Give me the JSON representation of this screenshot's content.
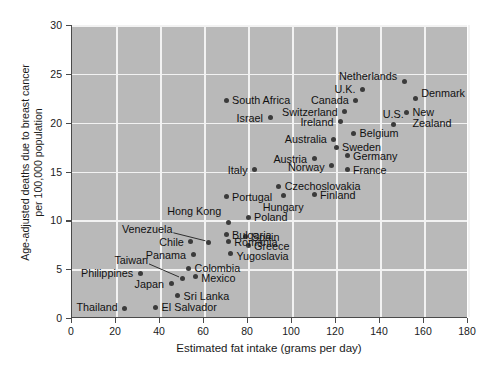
{
  "chart_data": {
    "type": "scatter",
    "title": "",
    "xlabel": "Estimated fat intake (grams per day)",
    "ylabel": "Age-adjusted deaths due to breast cancer per 100,000 population",
    "ylabel_line1": "Age-adjusted deaths due to breast cancer",
    "ylabel_line2": "per 100,000 population",
    "xlim": [
      0,
      180
    ],
    "ylim": [
      0,
      30
    ],
    "xticks": [
      0,
      20,
      40,
      60,
      80,
      100,
      120,
      140,
      160,
      180
    ],
    "yticks": [
      0,
      5,
      10,
      15,
      20,
      25,
      30
    ],
    "grid": true,
    "legend": "none",
    "plot_bg": "#b9b9b9",
    "grid_color": "#f2f2f2",
    "marker_color": "#3b3b3b",
    "points": [
      {
        "label": "Thailand",
        "x": 24,
        "y": 1.0,
        "side": "r",
        "dx": -7,
        "dy": -1,
        "leader": false
      },
      {
        "label": "El Salvador",
        "x": 38,
        "y": 1.1,
        "side": "l",
        "dx": 6,
        "dy": 0,
        "leader": false
      },
      {
        "label": "Sri Lanka",
        "x": 48,
        "y": 2.3,
        "side": "l",
        "dx": 6,
        "dy": 0,
        "leader": false
      },
      {
        "label": "Japan",
        "x": 45,
        "y": 3.5,
        "side": "r",
        "dx": -7,
        "dy": 0,
        "leader": false
      },
      {
        "label": "Taiwan",
        "x": 50,
        "y": 4.0,
        "side": "r",
        "dx": -34,
        "dy": -19,
        "leader": true
      },
      {
        "label": "Philippines",
        "x": 31,
        "y": 4.6,
        "side": "r",
        "dx": -7,
        "dy": 0,
        "leader": false
      },
      {
        "label": "Mexico",
        "x": 56,
        "y": 4.2,
        "side": "l",
        "dx": 6,
        "dy": 1,
        "leader": false
      },
      {
        "label": "Colombia",
        "x": 53,
        "y": 5.1,
        "side": "l",
        "dx": 6,
        "dy": 0,
        "leader": false
      },
      {
        "label": "Panama",
        "x": 55,
        "y": 6.5,
        "side": "r",
        "dx": -7,
        "dy": 0,
        "leader": false
      },
      {
        "label": "Yugoslavia",
        "x": 72,
        "y": 6.6,
        "side": "l",
        "dx": 6,
        "dy": 2,
        "leader": false
      },
      {
        "label": "Chile",
        "x": 54,
        "y": 7.8,
        "side": "r",
        "dx": -7,
        "dy": 0,
        "leader": false
      },
      {
        "label": "Greece",
        "x": 80,
        "y": 7.4,
        "side": "l",
        "dx": 6,
        "dy": 0,
        "leader": false
      },
      {
        "label": "Romania",
        "x": 71,
        "y": 7.8,
        "side": "l",
        "dx": 6,
        "dy": 0,
        "leader": false
      },
      {
        "label": "Venezuela",
        "x": 62,
        "y": 7.7,
        "side": "r",
        "dx": -36,
        "dy": -14,
        "leader": true
      },
      {
        "label": "Spain",
        "x": 79,
        "y": 8.3,
        "side": "l",
        "dx": 6,
        "dy": 0,
        "leader": false
      },
      {
        "label": "Bulgaria",
        "x": 70,
        "y": 8.5,
        "side": "l",
        "dx": 6,
        "dy": 0,
        "leader": false
      },
      {
        "label": "Hong Kong",
        "x": 71,
        "y": 9.8,
        "side": "r",
        "dx": -7,
        "dy": -11,
        "leader": false
      },
      {
        "label": "Poland",
        "x": 80,
        "y": 10.3,
        "side": "l",
        "dx": 6,
        "dy": 0,
        "leader": false
      },
      {
        "label": "Portugal",
        "x": 70,
        "y": 12.4,
        "side": "l",
        "dx": 6,
        "dy": 0,
        "leader": false
      },
      {
        "label": "Hungary",
        "x": 96,
        "y": 12.5,
        "side": "c",
        "dx": 0,
        "dy": 11,
        "leader": false
      },
      {
        "label": "Finland",
        "x": 110,
        "y": 12.6,
        "side": "l",
        "dx": 6,
        "dy": 0,
        "leader": false
      },
      {
        "label": "Czechoslovakia",
        "x": 94,
        "y": 13.5,
        "side": "l",
        "dx": 6,
        "dy": 0,
        "leader": false
      },
      {
        "label": "Italy",
        "x": 83,
        "y": 15.2,
        "side": "r",
        "dx": -7,
        "dy": 0,
        "leader": false
      },
      {
        "label": "Norway",
        "x": 118,
        "y": 15.6,
        "side": "r",
        "dx": -7,
        "dy": 1,
        "leader": false
      },
      {
        "label": "France",
        "x": 125,
        "y": 15.2,
        "side": "l",
        "dx": 6,
        "dy": 0,
        "leader": false
      },
      {
        "label": "Austria",
        "x": 110,
        "y": 16.3,
        "side": "r",
        "dx": -7,
        "dy": 0,
        "leader": false
      },
      {
        "label": "Germany",
        "x": 125,
        "y": 16.6,
        "side": "l",
        "dx": 6,
        "dy": 0,
        "leader": false
      },
      {
        "label": "Sweden",
        "x": 120,
        "y": 17.5,
        "side": "l",
        "dx": 6,
        "dy": 0,
        "leader": false
      },
      {
        "label": "Australia",
        "x": 119,
        "y": 18.3,
        "side": "r",
        "dx": -7,
        "dy": 0,
        "leader": false
      },
      {
        "label": "Belgium",
        "x": 128,
        "y": 18.9,
        "side": "l",
        "dx": 6,
        "dy": 0,
        "leader": false
      },
      {
        "label": "Israel",
        "x": 90,
        "y": 20.5,
        "side": "r",
        "dx": -7,
        "dy": 0,
        "leader": false
      },
      {
        "label": "Ireland",
        "x": 122,
        "y": 20.1,
        "side": "r",
        "dx": -7,
        "dy": 0,
        "leader": false
      },
      {
        "label": "U.S.",
        "x": 146,
        "y": 19.8,
        "side": "c",
        "dx": 0,
        "dy": -11,
        "leader": false
      },
      {
        "label": "Switzerland",
        "x": 124,
        "y": 21.1,
        "side": "r",
        "dx": -7,
        "dy": 0,
        "leader": false
      },
      {
        "label": "New",
        "x": 152,
        "y": 21.0,
        "side": "l",
        "dx": 6,
        "dy": -1,
        "leader": false
      },
      {
        "label": "Zealand",
        "x": 152,
        "y": 21.0,
        "side": "l",
        "dx": 6,
        "dy": 10,
        "leader": false,
        "textonly": true
      },
      {
        "label": "South Africa",
        "x": 70,
        "y": 22.3,
        "side": "l",
        "dx": 6,
        "dy": 0,
        "leader": false
      },
      {
        "label": "Canada",
        "x": 129,
        "y": 22.3,
        "side": "r",
        "dx": -7,
        "dy": 0,
        "leader": false
      },
      {
        "label": "Denmark",
        "x": 156,
        "y": 22.5,
        "side": "l",
        "dx": 6,
        "dy": -5,
        "leader": false
      },
      {
        "label": "U.K.",
        "x": 132,
        "y": 23.4,
        "side": "r",
        "dx": -7,
        "dy": 0,
        "leader": false
      },
      {
        "label": "Netherlands",
        "x": 151,
        "y": 24.2,
        "side": "r",
        "dx": -7,
        "dy": -6,
        "leader": false
      }
    ]
  }
}
